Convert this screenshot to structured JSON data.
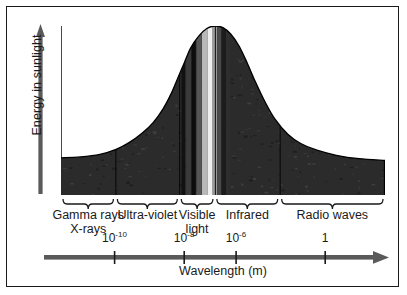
{
  "chart_data": {
    "type": "area",
    "title": "",
    "xlabel": "Wavelength (m)",
    "ylabel": "Energy in sunlight",
    "grid": false,
    "legend": null,
    "x_scale": "log",
    "x_tick_labels": [
      "10",
      "10",
      "10",
      "1"
    ],
    "x_tick_exponents": [
      "-10",
      "-8",
      "-6",
      ""
    ],
    "x_ticks": [
      {
        "label_base": "10",
        "exponent": "-10",
        "pos_pct": 16.5
      },
      {
        "label_base": "10",
        "exponent": "-8",
        "pos_pct": 38.0
      },
      {
        "label_base": "10",
        "exponent": "-6",
        "pos_pct": 54.0
      },
      {
        "label_base": "1",
        "exponent": "",
        "pos_pct": 81.5
      }
    ],
    "bands": [
      {
        "name": "Gamma rays X-rays",
        "line1": "Gamma rays",
        "line2": "X-rays",
        "start_pct": 0.0,
        "end_pct": 16.8
      },
      {
        "name": "Ultra-violet",
        "line1": "Ultra-violet",
        "line2": "",
        "start_pct": 16.8,
        "end_pct": 36.5
      },
      {
        "name": "Visible light",
        "line1": "Visible",
        "line2": "light",
        "start_pct": 36.5,
        "end_pct": 47.5
      },
      {
        "name": "Infrared",
        "line1": "Infrared",
        "line2": "",
        "start_pct": 47.5,
        "end_pct": 67.5
      },
      {
        "name": "Radio waves",
        "line1": "Radio waves",
        "line2": "",
        "start_pct": 67.5,
        "end_pct": 100.0
      }
    ],
    "curve_points_pct": [
      {
        "x": 0.0,
        "y": 22.0
      },
      {
        "x": 6.0,
        "y": 22.5
      },
      {
        "x": 12.0,
        "y": 24.0
      },
      {
        "x": 17.0,
        "y": 27.0
      },
      {
        "x": 21.0,
        "y": 31.0
      },
      {
        "x": 25.0,
        "y": 36.5
      },
      {
        "x": 28.5,
        "y": 43.0
      },
      {
        "x": 31.5,
        "y": 51.0
      },
      {
        "x": 34.0,
        "y": 60.0
      },
      {
        "x": 36.0,
        "y": 69.0
      },
      {
        "x": 38.0,
        "y": 78.0
      },
      {
        "x": 40.0,
        "y": 87.0
      },
      {
        "x": 42.5,
        "y": 94.0
      },
      {
        "x": 45.0,
        "y": 98.5
      },
      {
        "x": 47.5,
        "y": 100.0
      },
      {
        "x": 50.0,
        "y": 99.0
      },
      {
        "x": 52.5,
        "y": 95.0
      },
      {
        "x": 55.0,
        "y": 88.0
      },
      {
        "x": 57.5,
        "y": 78.0
      },
      {
        "x": 60.0,
        "y": 67.0
      },
      {
        "x": 63.0,
        "y": 55.0
      },
      {
        "x": 66.0,
        "y": 45.0
      },
      {
        "x": 70.0,
        "y": 36.0
      },
      {
        "x": 74.0,
        "y": 30.5
      },
      {
        "x": 79.0,
        "y": 26.5
      },
      {
        "x": 85.0,
        "y": 23.5
      },
      {
        "x": 92.0,
        "y": 21.5
      },
      {
        "x": 100.0,
        "y": 20.5
      }
    ],
    "visible_stripes": [
      {
        "pos_pct": 37.2,
        "width_pct": 1.1,
        "color": "#111111"
      },
      {
        "pos_pct": 38.6,
        "width_pct": 1.5,
        "color": "#3a3a3a"
      },
      {
        "pos_pct": 40.3,
        "width_pct": 1.3,
        "color": "#0d0d0d"
      },
      {
        "pos_pct": 41.8,
        "width_pct": 1.6,
        "color": "#555555"
      },
      {
        "pos_pct": 43.5,
        "width_pct": 1.8,
        "color": "#b8b8b8"
      },
      {
        "pos_pct": 45.3,
        "width_pct": 1.5,
        "color": "#efefef"
      },
      {
        "pos_pct": 46.8,
        "width_pct": 1.4,
        "color": "#9a9a9a"
      },
      {
        "pos_pct": 48.2,
        "width_pct": 1.2,
        "color": "#4a4a4a"
      },
      {
        "pos_pct": 49.6,
        "width_pct": 1.3,
        "color": "#1c1c1c"
      },
      {
        "pos_pct": 51.0,
        "width_pct": 1.1,
        "color": "#2e2e2e"
      }
    ],
    "band_divider_positions_pct": [
      16.8,
      36.5,
      47.5,
      67.5
    ],
    "fill_color": "#2b2b2b",
    "axis_color": "#4a4a4a",
    "text_color": "#1a1a1a"
  },
  "colors": {
    "frame": "#1a1a1a",
    "arrow": "#5a5a5a",
    "fill": "#2b2b2b",
    "background": "#ffffff"
  }
}
